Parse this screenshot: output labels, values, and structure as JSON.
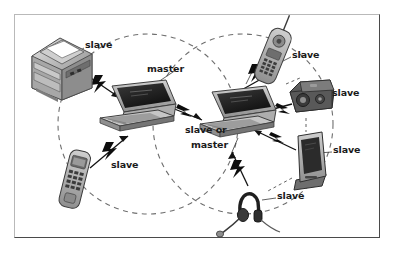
{
  "figure": {
    "kind": "network-topology-diagram",
    "background_color": "#ffffff",
    "frame": {
      "border_light": "#b9b9b9",
      "border_dark": "#4a4a4a"
    },
    "palette": {
      "ink": "#1b1b1b",
      "dashed_circle": "#6f6f6f",
      "device_fill": "#9a9a9a",
      "device_dark": "#3c3c3c",
      "device_light": "#d6d6d6",
      "bolt": "#111111"
    },
    "coverage_circles": [
      {
        "name": "left-piconet-coverage",
        "cx": 148,
        "cy": 124,
        "r": 90,
        "style": "dashed"
      },
      {
        "name": "right-piconet-coverage",
        "cx": 243,
        "cy": 124,
        "r": 90,
        "style": "dashed"
      }
    ],
    "labels": [
      {
        "id": "printer-role",
        "text": "slave",
        "x": 85,
        "y": 46,
        "align": "left"
      },
      {
        "id": "laptop1-role",
        "text": "master",
        "x": 148,
        "y": 70,
        "align": "left"
      },
      {
        "id": "cordless-role",
        "text": "slave",
        "x": 292,
        "y": 56,
        "align": "left"
      },
      {
        "id": "camera-role",
        "text": "slave",
        "x": 332,
        "y": 94,
        "align": "left"
      },
      {
        "id": "laptop2-role-1",
        "text": "slave or",
        "x": 186,
        "y": 131,
        "align": "left"
      },
      {
        "id": "laptop2-role-2",
        "text": "master",
        "x": 191,
        "y": 146,
        "align": "left"
      },
      {
        "id": "pda-role",
        "text": "slave",
        "x": 333,
        "y": 151,
        "align": "left"
      },
      {
        "id": "phone-role",
        "text": "slave",
        "x": 111,
        "y": 166,
        "align": "left"
      },
      {
        "id": "headset-role",
        "text": "slave",
        "x": 277,
        "y": 197,
        "align": "left"
      }
    ],
    "devices": [
      {
        "id": "portable-printer",
        "name": "printer-device",
        "role": "slave",
        "x": 30,
        "y": 36,
        "w": 62,
        "h": 64
      },
      {
        "id": "laptop-master",
        "name": "laptop-master-device",
        "role": "master",
        "x": 96,
        "y": 78,
        "w": 82,
        "h": 54
      },
      {
        "id": "laptop-bridge",
        "name": "laptop-bridge-device",
        "role": "slave or master",
        "x": 196,
        "y": 84,
        "w": 82,
        "h": 54
      },
      {
        "id": "cordless-phone",
        "name": "cordless-phone-device",
        "role": "slave",
        "x": 256,
        "y": 26,
        "w": 34,
        "h": 60
      },
      {
        "id": "digital-camera",
        "name": "camera-device",
        "role": "slave",
        "x": 288,
        "y": 78,
        "w": 48,
        "h": 42
      },
      {
        "id": "pda-cradle",
        "name": "pda-device",
        "role": "slave",
        "x": 293,
        "y": 132,
        "w": 38,
        "h": 56
      },
      {
        "id": "mobile-phone",
        "name": "mobile-phone-device",
        "role": "slave",
        "x": 62,
        "y": 152,
        "w": 26,
        "h": 56
      },
      {
        "id": "headset",
        "name": "headset-device",
        "role": "slave",
        "x": 234,
        "y": 186,
        "w": 48,
        "h": 48
      }
    ],
    "links": [
      {
        "from": "portable-printer",
        "to": "laptop-master",
        "type": "rf-bolt"
      },
      {
        "from": "mobile-phone",
        "to": "laptop-master",
        "type": "rf-bolt"
      },
      {
        "from": "laptop-master",
        "to": "laptop-bridge",
        "type": "rf-bolt"
      },
      {
        "from": "cordless-phone",
        "to": "laptop-bridge",
        "type": "rf-bolt"
      },
      {
        "from": "digital-camera",
        "to": "laptop-bridge",
        "type": "rf-bolt"
      },
      {
        "from": "pda-cradle",
        "to": "laptop-bridge",
        "type": "rf-bolt"
      },
      {
        "from": "headset",
        "to": "laptop-bridge",
        "type": "rf-bolt"
      }
    ],
    "leader_lines": [
      {
        "from": "printer-role",
        "to": "portable-printer"
      },
      {
        "from": "laptop1-role",
        "to": "laptop-master"
      },
      {
        "from": "cordless-role",
        "to": "cordless-phone"
      },
      {
        "from": "camera-role",
        "to": "digital-camera"
      },
      {
        "from": "pda-role",
        "to": "pda-cradle"
      },
      {
        "from": "headset-role",
        "to": "headset"
      }
    ]
  }
}
